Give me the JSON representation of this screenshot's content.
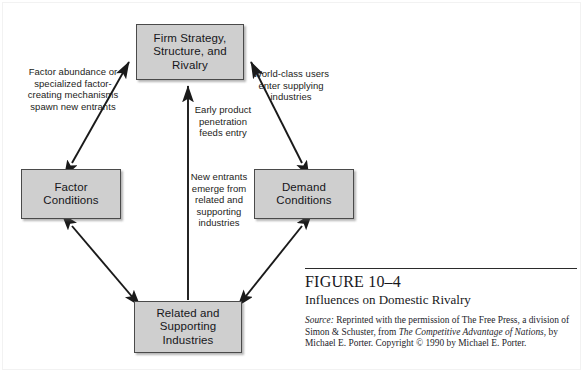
{
  "figure": {
    "number": "FIGURE 10–4",
    "title": "Influences on Domestic Rivalry",
    "source_label": "Source:",
    "source_text_1": " Reprinted with the permission of The Free Press, a division of Simon & Schuster, from ",
    "source_italic_1": "The Competitive Advantage of Nations",
    "source_text_2": ", by Michael E. Porter. Copyright © 1990 by Michael E. Porter."
  },
  "nodes": {
    "firm_strategy": "Firm Strategy,\nStructure, and\nRivalry",
    "factor_conditions": "Factor\nConditions",
    "demand_conditions": "Demand\nConditions",
    "related_supporting": "Related and\nSupporting\nIndustries"
  },
  "annotations": {
    "factor_abundance": "Factor abundance or\nspecialized factor-\ncreating mechanisms\nspawn new entrants",
    "world_class_users": "World-class users\nenter supplying\nindustries",
    "early_product": "Early product\npenetration\nfeeds entry",
    "new_entrants": "New entrants\nemerge from\nrelated and\nsupporting\nindustries"
  },
  "colors": {
    "box_fill": "#cfcfcf",
    "box_border": "#4a4a4a",
    "arrow": "#1a1a1a",
    "text": "#16161a",
    "background": "#ffffff"
  },
  "edges": [
    {
      "name": "factor-to-firm",
      "direction": "bidirectional"
    },
    {
      "name": "demand-to-firm",
      "direction": "bidirectional"
    },
    {
      "name": "factor-to-related",
      "direction": "bidirectional"
    },
    {
      "name": "demand-to-related",
      "direction": "bidirectional"
    },
    {
      "name": "related-to-firm",
      "direction": "up"
    }
  ]
}
